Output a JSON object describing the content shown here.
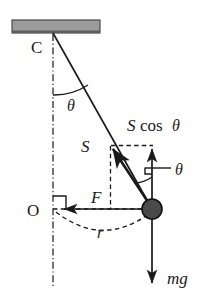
{
  "figure": {
    "type": "physics-force-diagram",
    "background_color": "#ffffff",
    "stroke_color": "#1a1a1a",
    "ceiling": {
      "name": "ceiling-support",
      "fill_color": "#9a9a9a",
      "edge_color": "#4d4d4d",
      "x": 12,
      "y": 20,
      "width": 88,
      "height": 13
    },
    "pivot": {
      "label": "C",
      "x": 53,
      "y": 33
    },
    "center": {
      "label": "O",
      "x": 53,
      "y": 209
    },
    "bob": {
      "name": "pendulum-bob",
      "fill_color": "#4a4a4a",
      "edge_color": "#111111",
      "cx": 152,
      "cy": 209,
      "r": 10
    },
    "labels": {
      "pivot_C": "C",
      "center_O": "O",
      "angle_top": "θ",
      "angle_bob": "θ",
      "tension": "S",
      "tension_vertical_component": "S cos θ",
      "tension_vertical_component_symbol": "S",
      "tension_vertical_component_fn": "cos",
      "tension_vertical_component_angle": "θ",
      "centripetal_force": "F",
      "radius": "r",
      "weight": "mg"
    },
    "vectors": [
      {
        "name": "tension-S",
        "label": "S",
        "from": [
          152,
          209
        ],
        "to": [
          110,
          146
        ],
        "style": "solid",
        "description": "tension along string toward pivot"
      },
      {
        "name": "tension-vertical-component",
        "label": "S cos θ",
        "from": [
          152,
          209
        ],
        "to": [
          152,
          146
        ],
        "style": "solid",
        "description": "vertical component of tension"
      },
      {
        "name": "centripetal-force-F",
        "label": "F",
        "from": [
          152,
          209
        ],
        "to": [
          62,
          209
        ],
        "style": "solid",
        "description": "horizontal centripetal force toward axis"
      },
      {
        "name": "weight-mg",
        "label": "mg",
        "from": [
          152,
          219
        ],
        "to": [
          152,
          285
        ],
        "style": "solid",
        "description": "weight acting downward"
      }
    ],
    "lines": [
      {
        "name": "string-line",
        "from": [
          53,
          33
        ],
        "to": [
          152,
          209
        ],
        "style": "solid"
      },
      {
        "name": "vertical-axis",
        "from": [
          53,
          33
        ],
        "to": [
          53,
          285
        ],
        "style": "dash-dot"
      },
      {
        "name": "radius-dashed-line",
        "from": [
          53,
          209
        ],
        "to": [
          152,
          209
        ],
        "style": "dashed"
      },
      {
        "name": "component-box-top",
        "from": [
          110,
          146
        ],
        "to": [
          152,
          146
        ],
        "style": "dashed"
      },
      {
        "name": "component-box-left",
        "from": [
          110,
          146
        ],
        "to": [
          110,
          209
        ],
        "style": "dashed"
      },
      {
        "name": "radius-arc",
        "from": [
          57,
          214
        ],
        "to": [
          150,
          214
        ],
        "style": "dashed-arc"
      }
    ],
    "markers": [
      {
        "name": "right-angle-at-O",
        "x": 53,
        "y": 209
      },
      {
        "name": "right-angle-at-bob",
        "x": 152,
        "y": 172
      },
      {
        "name": "angle-arc-top",
        "center": [
          53,
          33
        ],
        "radius": 62
      },
      {
        "name": "angle-arc-bob",
        "center": [
          152,
          209
        ],
        "radius": 34
      }
    ]
  }
}
